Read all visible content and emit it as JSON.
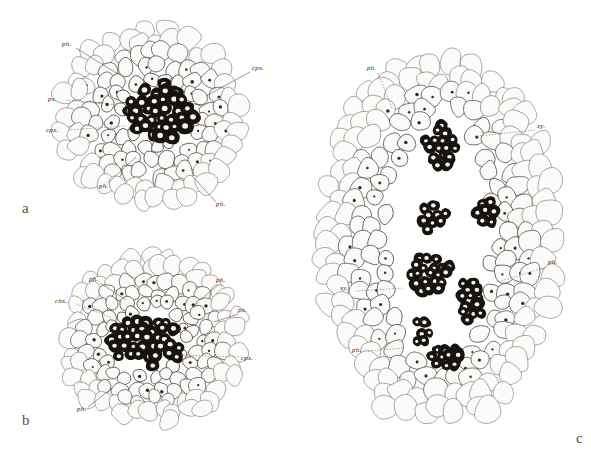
{
  "figure": {
    "kind": "botanical-plate",
    "background_color": "#ffffff",
    "ink_color": "#4b4641",
    "xylem_color": "#17140f",
    "label_color": "#2a2724"
  },
  "panels": [
    {
      "id": "a",
      "letter": "a",
      "letter_pos": {
        "x": 22,
        "y": 213
      },
      "center": {
        "x": 152,
        "y": 116
      },
      "radius_x": 92,
      "radius_y": 88,
      "core": {
        "x": 158,
        "y": 113,
        "rx": 36,
        "ry": 30
      },
      "annotations": [
        {
          "text": "ph.",
          "x": 62,
          "y": 46,
          "anchor": "start",
          "leader": [
            [
              76,
              48
            ],
            [
              118,
              74
            ]
          ],
          "style": "solid"
        },
        {
          "text": "cpx.",
          "x": 252,
          "y": 70,
          "anchor": "start",
          "leader": [
            [
              250,
              72
            ],
            [
              206,
              96
            ]
          ],
          "style": "solid"
        },
        {
          "text": "px.",
          "x": 48,
          "y": 101,
          "anchor": "start",
          "leader": [
            [
              66,
              100
            ],
            [
              118,
              105
            ]
          ],
          "style": "dashed"
        },
        {
          "text": "cpx.",
          "x": 46,
          "y": 132,
          "anchor": "start",
          "leader": [
            [
              68,
              130
            ],
            [
              126,
              126
            ]
          ],
          "style": "dashed"
        },
        {
          "text": "ph.",
          "x": 99,
          "y": 188,
          "anchor": "start",
          "leader": [
            [
              108,
              183
            ],
            [
              136,
              157
            ]
          ],
          "style": "solid"
        },
        {
          "text": "ph.",
          "x": 216,
          "y": 206,
          "anchor": "start",
          "leader": [
            [
              216,
              202
            ],
            [
              192,
              176
            ]
          ],
          "style": "solid"
        }
      ]
    },
    {
      "id": "b",
      "letter": "b",
      "letter_pos": {
        "x": 22,
        "y": 425
      },
      "center": {
        "x": 152,
        "y": 340
      },
      "radius_x": 92,
      "radius_y": 83,
      "core": {
        "x": 145,
        "y": 341,
        "rx": 40,
        "ry": 28
      },
      "annotations": [
        {
          "text": "ph.",
          "x": 89,
          "y": 281,
          "anchor": "start",
          "leader": [
            [
              100,
              283
            ],
            [
              126,
              300
            ]
          ],
          "style": "solid"
        },
        {
          "text": "ph.",
          "x": 216,
          "y": 282,
          "anchor": "start",
          "leader": [
            [
              218,
              285
            ],
            [
              200,
              300
            ]
          ],
          "style": "solid"
        },
        {
          "text": "cbx.",
          "x": 55,
          "y": 303,
          "anchor": "start",
          "leader": [
            [
              76,
              304
            ],
            [
              112,
              318
            ]
          ],
          "style": "dashed"
        },
        {
          "text": "px.",
          "x": 238,
          "y": 312,
          "anchor": "start",
          "leader": [
            [
              238,
              314
            ],
            [
              214,
              322
            ]
          ],
          "style": "solid"
        },
        {
          "text": "cpx.",
          "x": 241,
          "y": 360,
          "anchor": "start",
          "leader": [
            [
              239,
              357
            ],
            [
              176,
              355
            ]
          ],
          "style": "dashed"
        },
        {
          "text": "ph.",
          "x": 77,
          "y": 411,
          "anchor": "start",
          "leader": [
            [
              88,
              407
            ],
            [
              112,
              388
            ]
          ],
          "style": "solid"
        }
      ]
    },
    {
      "id": "c",
      "letter": "c",
      "letter_pos": {
        "x": 576,
        "y": 443
      },
      "center": {
        "x": 440,
        "y": 240
      },
      "radius_x": 118,
      "radius_y": 190,
      "core": {
        "x": 440,
        "y": 240,
        "rx": 52,
        "ry": 132
      },
      "annotations": [
        {
          "text": "ph.",
          "x": 367,
          "y": 70,
          "anchor": "start",
          "leader": [
            [
              378,
              73
            ],
            [
              392,
              108
            ]
          ],
          "style": "dashed"
        },
        {
          "text": "xy.",
          "x": 537,
          "y": 128,
          "anchor": "start",
          "leader": [
            [
              535,
              130
            ],
            [
              478,
              136
            ]
          ],
          "style": "dashed"
        },
        {
          "text": "ph.",
          "x": 548,
          "y": 264,
          "anchor": "start",
          "leader": [
            [
              546,
              267
            ],
            [
              498,
              282
            ]
          ],
          "style": "dashed"
        },
        {
          "text": "xy.",
          "x": 340,
          "y": 290,
          "anchor": "start",
          "leader": [
            [
              356,
              291
            ],
            [
              404,
              288
            ]
          ],
          "style": "dashed"
        },
        {
          "text": "ph.",
          "x": 352,
          "y": 352,
          "anchor": "start",
          "leader": [
            [
              368,
              351
            ],
            [
              404,
              348
            ]
          ],
          "style": "dashed"
        }
      ]
    }
  ],
  "label_glossary": [
    {
      "abbr": "ph.",
      "meaning": "phloem"
    },
    {
      "abbr": "px.",
      "meaning": "protoxylem"
    },
    {
      "abbr": "cpx.",
      "meaning": "central protoxylem"
    },
    {
      "abbr": "cbx.",
      "meaning": "central bundle xylem"
    },
    {
      "abbr": "xy.",
      "meaning": "xylem"
    }
  ]
}
